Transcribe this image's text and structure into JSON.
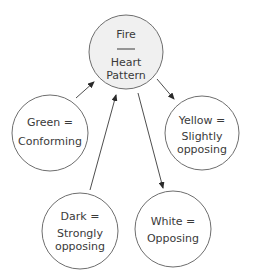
{
  "diagram": {
    "center_node": {
      "id": "fire",
      "title": "Fire",
      "subtitle_line1": "Heart",
      "subtitle_line2": "Pattern",
      "cx": 126,
      "cy": 52,
      "r": 37,
      "fill": "#f0f0f0"
    },
    "nodes": [
      {
        "id": "green",
        "line1": "Green =",
        "line2": "Conforming",
        "cx": 50,
        "cy": 133,
        "r": 38,
        "fill": "#ffffff"
      },
      {
        "id": "yellow",
        "line1": "Yellow =",
        "line2": "Slightly",
        "line3": "opposing",
        "cx": 202,
        "cy": 133,
        "r": 37,
        "fill": "#ffffff"
      },
      {
        "id": "dark",
        "line1": "Dark =",
        "line2": "Strongly",
        "line3": "opposing",
        "cx": 80,
        "cy": 231,
        "r": 38,
        "fill": "#ffffff"
      },
      {
        "id": "white",
        "line1": "White =",
        "line2": "Opposing",
        "cx": 173,
        "cy": 229,
        "r": 38,
        "fill": "#ffffff"
      }
    ],
    "edges": [
      {
        "from": "green",
        "to": "fire",
        "x1": 76,
        "y1": 98,
        "x2": 94,
        "y2": 82
      },
      {
        "from": "dark",
        "to": "fire",
        "x1": 90,
        "y1": 190,
        "x2": 116,
        "y2": 95
      },
      {
        "from": "fire",
        "to": "white",
        "x1": 138,
        "y1": 93,
        "x2": 163,
        "y2": 188
      },
      {
        "from": "fire",
        "to": "yellow",
        "x1": 157,
        "y1": 79,
        "x2": 174,
        "y2": 99
      }
    ],
    "colors": {
      "stroke": "#6e6e6e",
      "text": "#3a3a3a",
      "arrow": "#2a2a2a",
      "center_fill": "#f0f0f0"
    }
  }
}
